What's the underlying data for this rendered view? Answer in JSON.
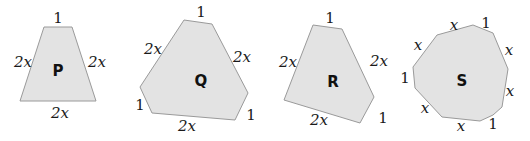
{
  "colors": {
    "fill": "#e3e3e3",
    "stroke": "#9a9a9a",
    "text": "#1a1a1a"
  },
  "shapes": [
    {
      "name": "P",
      "points": "44,27 72,27 96,101 20,101",
      "name_pos": [
        58,
        71
      ],
      "labels": [
        {
          "text": "1",
          "x": 58,
          "y": 23,
          "italic": false
        },
        {
          "text": "2x",
          "x": 23,
          "y": 67,
          "italic": true
        },
        {
          "text": "2x",
          "x": 97,
          "y": 67,
          "italic": true
        },
        {
          "text": "2x",
          "x": 60,
          "y": 118,
          "italic": true
        }
      ]
    },
    {
      "name": "Q",
      "points": "184,20 212,24 248,93 235,120 152,113 140,87",
      "name_pos": [
        201,
        81
      ],
      "labels": [
        {
          "text": "1",
          "x": 201,
          "y": 17,
          "italic": false
        },
        {
          "text": "2x",
          "x": 153,
          "y": 54,
          "italic": true
        },
        {
          "text": "2x",
          "x": 242,
          "y": 62,
          "italic": true
        },
        {
          "text": "1",
          "x": 140,
          "y": 110,
          "italic": false
        },
        {
          "text": "1",
          "x": 251,
          "y": 120,
          "italic": false
        },
        {
          "text": "2x",
          "x": 187,
          "y": 131,
          "italic": true
        }
      ]
    },
    {
      "name": "R",
      "points": "313,25 342,29 374,97 360,123 284,100",
      "name_pos": [
        333,
        82
      ],
      "labels": [
        {
          "text": "1",
          "x": 330,
          "y": 23,
          "italic": false
        },
        {
          "text": "2x",
          "x": 288,
          "y": 67,
          "italic": true
        },
        {
          "text": "2x",
          "x": 379,
          "y": 66,
          "italic": true
        },
        {
          "text": "2x",
          "x": 319,
          "y": 125,
          "italic": true
        },
        {
          "text": "1",
          "x": 383,
          "y": 123,
          "italic": false
        }
      ]
    },
    {
      "name": "S",
      "points": "437,35 473,25 493,33 508,69 502,107 493,115 480,121 442,117 415,88 413,67",
      "name_pos": [
        462,
        81
      ],
      "labels": [
        {
          "text": "x",
          "x": 454,
          "y": 30,
          "italic": true
        },
        {
          "text": "1",
          "x": 486,
          "y": 28,
          "italic": false
        },
        {
          "text": "x",
          "x": 418,
          "y": 50,
          "italic": true
        },
        {
          "text": "x",
          "x": 509,
          "y": 55,
          "italic": true
        },
        {
          "text": "1",
          "x": 405,
          "y": 83,
          "italic": false
        },
        {
          "text": "x",
          "x": 510,
          "y": 96,
          "italic": true
        },
        {
          "text": "x",
          "x": 425,
          "y": 113,
          "italic": true
        },
        {
          "text": "1",
          "x": 493,
          "y": 129,
          "italic": false
        },
        {
          "text": "x",
          "x": 461,
          "y": 131,
          "italic": true
        }
      ]
    }
  ]
}
